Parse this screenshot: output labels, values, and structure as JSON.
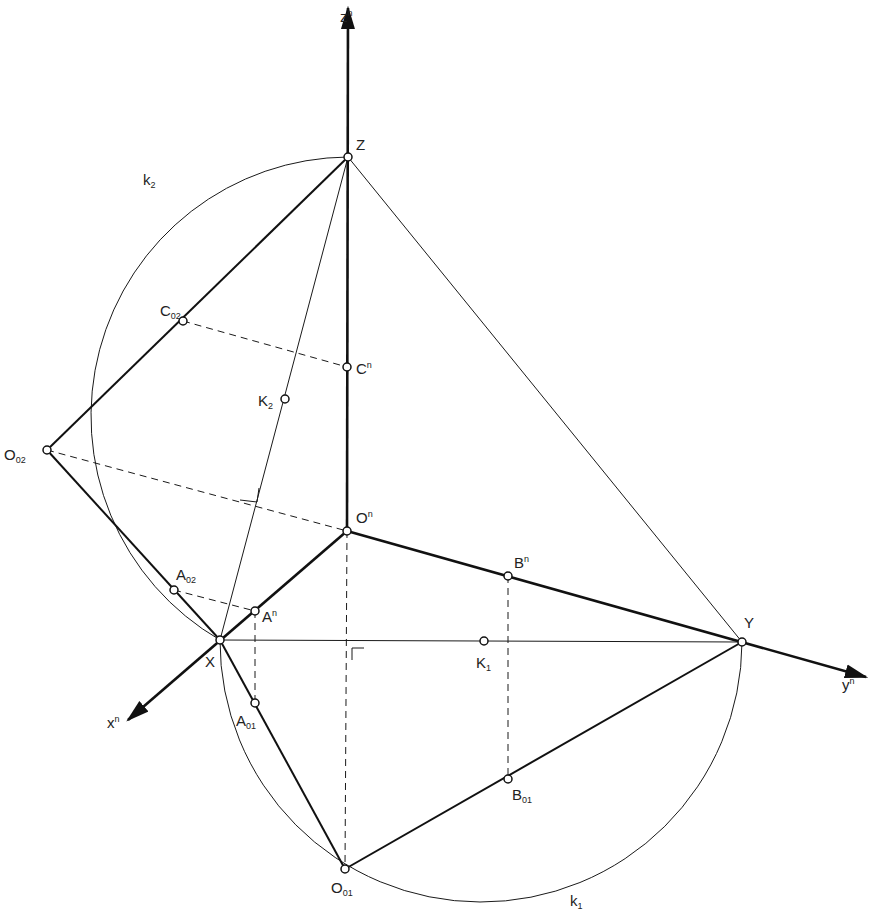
{
  "diagram": {
    "type": "axonometry-construction",
    "axes": {
      "z": {
        "label": "z",
        "sup": "n"
      },
      "y": {
        "label": "y",
        "sup": "n"
      },
      "x": {
        "label": "x",
        "sup": "n"
      }
    },
    "circles": {
      "k1": {
        "label": "k",
        "sub": "1"
      },
      "k2": {
        "label": "k",
        "sub": "2"
      }
    },
    "points": {
      "Z": {
        "label": "Z"
      },
      "X": {
        "label": "X"
      },
      "Y": {
        "label": "Y"
      },
      "On": {
        "label": "O",
        "sup": "n"
      },
      "Cn": {
        "label": "C",
        "sup": "n"
      },
      "An": {
        "label": "A",
        "sup": "n"
      },
      "Bn": {
        "label": "B",
        "sup": "n"
      },
      "K1": {
        "label": "K",
        "sub": "1"
      },
      "K2": {
        "label": "K",
        "sub": "2"
      },
      "O02": {
        "label": "O",
        "sub": "02"
      },
      "C02": {
        "label": "C",
        "sub": "02"
      },
      "A02": {
        "label": "A",
        "sub": "02"
      },
      "O01": {
        "label": "O",
        "sub": "01"
      },
      "A01": {
        "label": "A",
        "sub": "01"
      },
      "B01": {
        "label": "B",
        "sub": "01"
      }
    }
  }
}
